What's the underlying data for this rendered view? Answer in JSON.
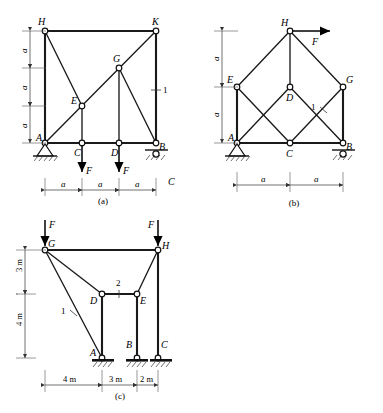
{
  "figures": [
    {
      "id": "a",
      "caption": "(a)",
      "nodes": [
        {
          "label": "H"
        },
        {
          "label": "K"
        },
        {
          "label": "G"
        },
        {
          "label": "E"
        },
        {
          "label": "A"
        },
        {
          "label": "C"
        },
        {
          "label": "D"
        },
        {
          "label": "B"
        }
      ],
      "loads": [
        {
          "label": "F",
          "direction": "down",
          "at": "C"
        },
        {
          "label": "F",
          "direction": "down",
          "at": "D"
        }
      ],
      "member_labels": [
        {
          "label": "1",
          "member": "K-B"
        }
      ],
      "vertical_dims": [
        {
          "label": "a"
        },
        {
          "label": "a"
        },
        {
          "label": "a"
        }
      ],
      "horizontal_dims": [
        {
          "label": "a"
        },
        {
          "label": "a"
        },
        {
          "label": "a"
        }
      ],
      "supports": [
        {
          "type": "pin",
          "at": "A"
        },
        {
          "type": "roller",
          "at": "B"
        }
      ]
    },
    {
      "id": "b",
      "caption": "(b)",
      "nodes": [
        {
          "label": "H"
        },
        {
          "label": "E"
        },
        {
          "label": "G"
        },
        {
          "label": "D"
        },
        {
          "label": "A"
        },
        {
          "label": "C"
        },
        {
          "label": "B"
        }
      ],
      "loads": [
        {
          "label": "F",
          "direction": "right",
          "at": "H"
        }
      ],
      "member_labels": [
        {
          "label": "1",
          "member": "D-G"
        }
      ],
      "vertical_dims": [
        {
          "label": "a"
        },
        {
          "label": "a"
        }
      ],
      "horizontal_dims": [
        {
          "label": "a"
        },
        {
          "label": "a"
        }
      ],
      "supports": [
        {
          "type": "pin",
          "at": "A"
        },
        {
          "type": "roller",
          "at": "B"
        }
      ]
    },
    {
      "id": "c",
      "caption": "(c)",
      "nodes": [
        {
          "label": "G"
        },
        {
          "label": "H"
        },
        {
          "label": "D"
        },
        {
          "label": "E"
        },
        {
          "label": "A"
        },
        {
          "label": "B"
        },
        {
          "label": "C"
        }
      ],
      "loads": [
        {
          "label": "F",
          "direction": "down",
          "at": "G"
        },
        {
          "label": "F",
          "direction": "down",
          "at": "H"
        }
      ],
      "member_labels": [
        {
          "label": "1",
          "member": "G-A"
        },
        {
          "label": "2",
          "member": "D-E"
        }
      ],
      "vertical_dims": [
        {
          "label": "3 m"
        },
        {
          "label": "4 m"
        }
      ],
      "horizontal_dims": [
        {
          "label": "4 m"
        },
        {
          "label": "3 m"
        },
        {
          "label": "2 m"
        }
      ],
      "supports": [
        {
          "type": "fixed-base",
          "at": "A"
        },
        {
          "type": "fixed-base",
          "at": "B"
        },
        {
          "type": "fixed-base",
          "at": "C"
        }
      ]
    }
  ],
  "stray_label": "C",
  "colors": {
    "line": "#1a1a1a",
    "node_fill": "#ffffff",
    "dimension": "#333333",
    "background": "#ffffff"
  }
}
